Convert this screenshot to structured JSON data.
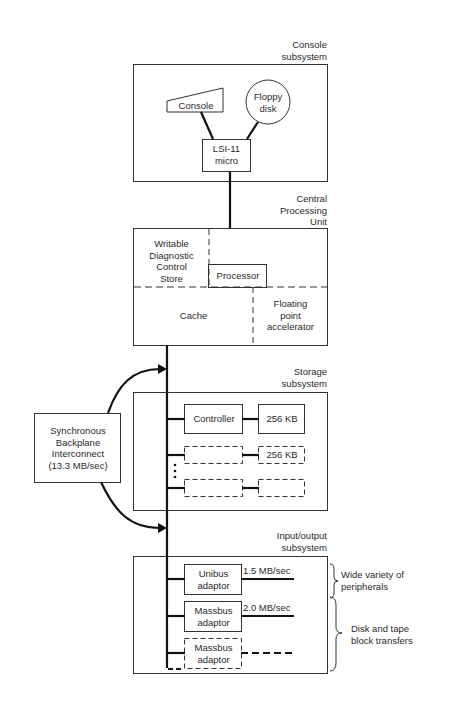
{
  "console_subsystem": {
    "title_line1": "Console",
    "title_line2": "subsystem",
    "console": "Console",
    "floppy_line1": "Floppy",
    "floppy_line2": "disk",
    "lsi_line1": "LSI-11",
    "lsi_line2": "micro"
  },
  "cpu": {
    "title_line1": "Central",
    "title_line2": "Processing",
    "title_line3": "Unit",
    "wcs_line1": "Writable",
    "wcs_line2": "Diagnostic",
    "wcs_line3": "Control",
    "wcs_line4": "Store",
    "processor": "Processor",
    "cache": "Cache",
    "fpa_line1": "Floating",
    "fpa_line2": "point",
    "fpa_line3": "accelerator"
  },
  "sbi": {
    "line1": "Synchronous",
    "line2": "Backplane",
    "line3": "Interconnect",
    "line4": "(13.3 MB/sec)"
  },
  "storage": {
    "title_line1": "Storage",
    "title_line2": "subsystem",
    "controller": "Controller",
    "memory1": "256 KB",
    "memory2": "256 KB"
  },
  "io": {
    "title_line1": "Input/output",
    "title_line2": "subsystem",
    "unibus_line1": "Unibus",
    "unibus_line2": "adaptor",
    "unibus_rate": "1.5 MB/sec",
    "massbus_line1": "Massbus",
    "massbus_line2": "adaptor",
    "massbus_rate": "2.0 MB/sec",
    "massbus2_line1": "Massbus",
    "massbus2_line2": "adaptor",
    "note1_line1": "Wide variety of",
    "note1_line2": "peripherals",
    "note2_line1": "Disk and tape",
    "note2_line2": "block transfers"
  }
}
